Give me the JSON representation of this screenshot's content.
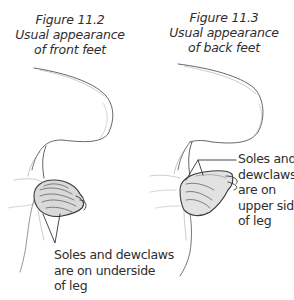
{
  "figures": [
    {
      "id": "11.2",
      "caption": {
        "number": "Figure 11.2",
        "line2": "Usual appearance",
        "line3": "of front feet"
      },
      "annotation": {
        "line1": "Soles and dewclaws",
        "line2": "are on underside",
        "line3": "of leg"
      },
      "illustration": "front-foot-drawing"
    },
    {
      "id": "11.3",
      "caption": {
        "number": "Figure 11.3",
        "line2": "Usual appearance",
        "line3": "of back feet"
      },
      "annotation": {
        "line1": "Soles and",
        "line2": "dewclaws",
        "line3": "are on",
        "line4": "upper side",
        "line5": "of leg"
      },
      "illustration": "back-foot-drawing"
    }
  ],
  "colors": {
    "ink": "#2e2e2e",
    "background": "#ffffff"
  }
}
